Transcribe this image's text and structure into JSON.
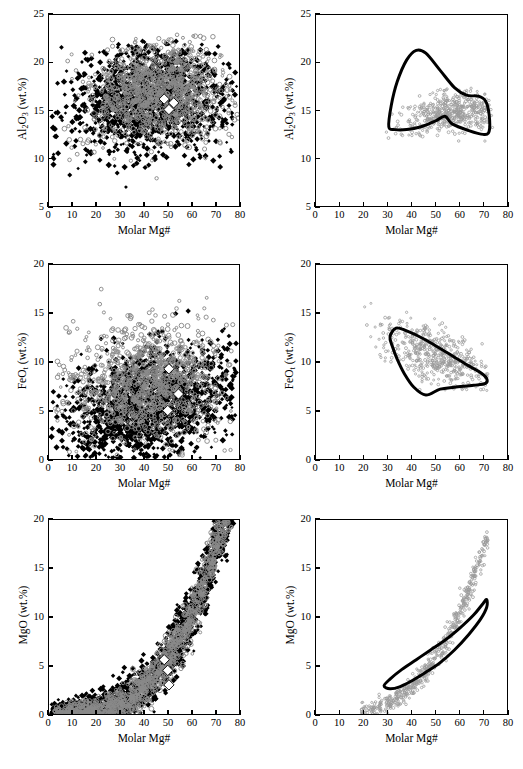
{
  "figure": {
    "layout": "3 rows x 2 columns of scatter plots",
    "columns": [
      "global compilation (filled markers)",
      "restricted subset with outlined field (open markers)"
    ]
  },
  "axes": {
    "x_title_html": "Molar Mg#",
    "x_ticks": [
      0,
      10,
      20,
      30,
      40,
      50,
      60,
      70,
      80
    ],
    "x_range": [
      0,
      80
    ],
    "y_ticks_al": [
      5,
      10,
      15,
      20,
      25
    ],
    "y_range_al": [
      5,
      25
    ],
    "y_ticks_fe": [
      0,
      5,
      10,
      15,
      20
    ],
    "y_range_fe": [
      0,
      20
    ],
    "y_ticks_mg": [
      0,
      5,
      10,
      15,
      20
    ],
    "y_range_mg": [
      0,
      20
    ],
    "y_title_al_html": "Al<sub>2</sub>O<sub>3</sub> (wt.%)",
    "y_title_fe_html": "FeO<sub>t</sub> (wt.%)",
    "y_title_mg_html": "MgO (wt.%)"
  },
  "colors": {
    "axis": "#000000",
    "dense_dark": "#000000",
    "dense_gray": "#8a8a8a",
    "open_marker": "#9a9a9a",
    "contour": "#000000",
    "diamond_fill": "#ffffff",
    "background": "#ffffff"
  },
  "chart_data": [
    {
      "type": "scatter",
      "id": "al2o3-global",
      "title": "",
      "xlabel": "Molar Mg#",
      "ylabel": "Al2O3 (wt.%)",
      "xlim": [
        0,
        80
      ],
      "ylim": [
        5,
        25
      ],
      "xticks": [
        0,
        10,
        20,
        30,
        40,
        50,
        60,
        70,
        80
      ],
      "yticks": [
        5,
        10,
        15,
        20,
        25
      ],
      "grid": false,
      "legend": "none",
      "series": [
        {
          "name": "dark filled cloud",
          "marker": "filled-diamond-dark",
          "color": "#000000",
          "n_points": 1500,
          "cloud": {
            "x_center": 42,
            "y_center": 16.4,
            "x_spread": 17,
            "y_spread": 2.7,
            "x_min": 1,
            "x_max": 79,
            "y_min": 6.2,
            "y_max": 22.6,
            "correlation": 0.1
          }
        },
        {
          "name": "gray open cloud",
          "marker": "open-circle-gray",
          "color": "#8a8a8a",
          "n_points": 1100,
          "cloud": {
            "x_center": 46,
            "y_center": 17.2,
            "x_spread": 15,
            "y_spread": 2.6,
            "x_min": 2,
            "x_max": 80,
            "y_min": 5.2,
            "y_max": 23.0,
            "correlation": 0.05
          }
        },
        {
          "name": "reference averages",
          "marker": "white-diamond",
          "color": "#ffffff",
          "points": [
            [
              48.5,
              16.2
            ],
            [
              52.5,
              15.8
            ],
            [
              50.5,
              15.1
            ]
          ]
        }
      ]
    },
    {
      "type": "scatter",
      "id": "al2o3-subset",
      "title": "",
      "xlabel": "Molar Mg#",
      "ylabel": "Al2O3 (wt.%)",
      "xlim": [
        0,
        80
      ],
      "ylim": [
        5,
        25
      ],
      "xticks": [
        0,
        10,
        20,
        30,
        40,
        50,
        60,
        70,
        80
      ],
      "yticks": [
        5,
        10,
        15,
        20,
        25
      ],
      "grid": false,
      "legend": "none",
      "series": [
        {
          "name": "subset open markers",
          "marker": "open-small-gray",
          "color": "#9a9a9a",
          "n_points": 520,
          "cloud": {
            "x_center": 57,
            "y_center": 15.1,
            "x_spread": 11,
            "y_spread": 1.2,
            "x_min": 18,
            "x_max": 74,
            "y_min": 11.2,
            "y_max": 18.4,
            "correlation": 0.55
          }
        }
      ],
      "contour": {
        "name": "field outline",
        "stroke": "#000000",
        "stroke_width": 3.0,
        "vertices": [
          [
            30.5,
            13.3
          ],
          [
            31.5,
            15.5
          ],
          [
            34,
            18.0
          ],
          [
            38,
            20.3
          ],
          [
            42,
            21.3
          ],
          [
            46,
            21.0
          ],
          [
            52,
            19.2
          ],
          [
            58,
            17.4
          ],
          [
            63,
            16.6
          ],
          [
            68,
            16.5
          ],
          [
            71,
            16.0
          ],
          [
            72.5,
            14.6
          ],
          [
            72.5,
            12.8
          ],
          [
            70,
            12.5
          ],
          [
            64,
            12.9
          ],
          [
            57,
            13.6
          ],
          [
            54,
            14.4
          ],
          [
            50,
            13.9
          ],
          [
            44,
            13.3
          ],
          [
            38,
            13.0
          ],
          [
            33,
            13.0
          ]
        ]
      }
    },
    {
      "type": "scatter",
      "id": "feot-global",
      "title": "",
      "xlabel": "Molar Mg#",
      "ylabel": "FeOt (wt.%)",
      "xlim": [
        0,
        80
      ],
      "ylim": [
        0,
        20
      ],
      "xticks": [
        0,
        10,
        20,
        30,
        40,
        50,
        60,
        70,
        80
      ],
      "yticks": [
        0,
        5,
        10,
        15,
        20
      ],
      "grid": false,
      "legend": "none",
      "series": [
        {
          "name": "dark filled cloud",
          "marker": "filled-diamond-dark",
          "color": "#000000",
          "n_points": 1600,
          "cloud": {
            "x_center": 42,
            "y_center": 5.6,
            "x_spread": 18,
            "y_spread": 2.9,
            "x_min": 1,
            "x_max": 79,
            "y_min": 0.1,
            "y_max": 16.1,
            "correlation": 0.3
          }
        },
        {
          "name": "gray open cloud",
          "marker": "open-circle-gray",
          "color": "#8a8a8a",
          "n_points": 1100,
          "cloud": {
            "x_center": 41,
            "y_center": 7.6,
            "x_spread": 16,
            "y_spread": 3.0,
            "x_min": 2,
            "x_max": 79,
            "y_min": 0.3,
            "y_max": 19.1,
            "correlation": 0.1
          }
        },
        {
          "name": "reference averages",
          "marker": "white-diamond",
          "color": "#ffffff",
          "points": [
            [
              50.5,
              9.3
            ],
            [
              54.5,
              6.7
            ],
            [
              50.0,
              5.0
            ]
          ]
        }
      ]
    },
    {
      "type": "scatter",
      "id": "feot-subset",
      "title": "",
      "xlabel": "Molar Mg#",
      "ylabel": "FeOt (wt.%)",
      "xlim": [
        0,
        80
      ],
      "ylim": [
        0,
        20
      ],
      "xticks": [
        0,
        10,
        20,
        30,
        40,
        50,
        60,
        70,
        80
      ],
      "yticks": [
        0,
        5,
        10,
        15,
        20
      ],
      "grid": false,
      "legend": "none",
      "series": [
        {
          "name": "subset open markers",
          "marker": "open-small-gray",
          "color": "#9a9a9a",
          "n_points": 520,
          "cloud": {
            "x_center": 52,
            "y_center": 10.4,
            "x_spread": 12,
            "y_spread": 1.9,
            "x_min": 19,
            "x_max": 72,
            "y_min": 6.8,
            "y_max": 17.3,
            "correlation": -0.62
          }
        }
      ],
      "contour": {
        "name": "field outline",
        "stroke": "#000000",
        "stroke_width": 3.0,
        "vertices": [
          [
            31,
            12.6
          ],
          [
            33.5,
            13.5
          ],
          [
            38,
            13.2
          ],
          [
            45,
            12.4
          ],
          [
            52,
            11.4
          ],
          [
            58,
            10.5
          ],
          [
            64,
            9.6
          ],
          [
            69,
            8.9
          ],
          [
            71.5,
            8.3
          ],
          [
            71,
            7.8
          ],
          [
            66,
            7.6
          ],
          [
            58,
            7.4
          ],
          [
            52,
            7.2
          ],
          [
            46,
            6.6
          ],
          [
            41,
            7.4
          ],
          [
            37,
            8.8
          ],
          [
            34,
            10.3
          ],
          [
            32,
            11.6
          ]
        ]
      }
    },
    {
      "type": "scatter",
      "id": "mgo-global",
      "title": "",
      "xlabel": "Molar Mg#",
      "ylabel": "MgO (wt.%)",
      "xlim": [
        0,
        80
      ],
      "ylim": [
        0,
        20
      ],
      "xticks": [
        0,
        10,
        20,
        30,
        40,
        50,
        60,
        70,
        80
      ],
      "yticks": [
        0,
        5,
        10,
        15,
        20
      ],
      "grid": false,
      "legend": "none",
      "series": [
        {
          "name": "dark filled cloud",
          "marker": "filled-diamond-dark",
          "color": "#000000",
          "n_points": 1700,
          "curve": {
            "form": "exponential-rise",
            "x_min": 1,
            "x_max": 80,
            "y_at_x10": 0.35,
            "y_at_x30": 1.6,
            "y_at_x50": 4.0,
            "y_at_x65": 7.2,
            "y_at_x78": 15.5,
            "y_spread": 1.5
          },
          "correlation": 0.92
        },
        {
          "name": "gray open cloud",
          "marker": "open-circle-gray",
          "color": "#8a8a8a",
          "n_points": 1200,
          "curve": {
            "form": "exponential-rise",
            "x_min": 2,
            "x_max": 80,
            "y_at_x10": 0.45,
            "y_at_x30": 2.0,
            "y_at_x50": 4.6,
            "y_at_x65": 8.2,
            "y_at_x78": 16.5,
            "y_spread": 1.3
          },
          "correlation": 0.93
        },
        {
          "name": "reference averages",
          "marker": "white-diamond",
          "color": "#ffffff",
          "points": [
            [
              48.5,
              5.6
            ],
            [
              50.0,
              4.5
            ],
            [
              50.5,
              3.0
            ]
          ]
        }
      ]
    },
    {
      "type": "scatter",
      "id": "mgo-subset",
      "title": "",
      "xlabel": "Molar Mg#",
      "ylabel": "MgO (wt.%)",
      "xlim": [
        0,
        80
      ],
      "ylim": [
        0,
        20
      ],
      "xticks": [
        0,
        10,
        20,
        30,
        40,
        50,
        60,
        70,
        80
      ],
      "yticks": [
        0,
        5,
        10,
        15,
        20
      ],
      "grid": false,
      "legend": "none",
      "series": [
        {
          "name": "subset open markers",
          "marker": "open-small-gray",
          "color": "#9a9a9a",
          "n_points": 520,
          "curve": {
            "form": "exponential-rise",
            "x_min": 19,
            "x_max": 72,
            "y_at_x30": 3.1,
            "y_at_x50": 5.6,
            "y_at_x60": 7.4,
            "y_at_x70": 9.8,
            "y_spread": 0.7
          },
          "correlation": 0.93
        }
      ],
      "contour": {
        "name": "field outline",
        "stroke": "#000000",
        "stroke_width": 3.0,
        "vertices": [
          [
            28.5,
            2.9
          ],
          [
            31,
            3.6
          ],
          [
            36,
            4.6
          ],
          [
            42,
            5.6
          ],
          [
            48,
            6.6
          ],
          [
            54,
            7.6
          ],
          [
            60,
            8.8
          ],
          [
            66,
            10.2
          ],
          [
            70,
            11.4
          ],
          [
            71.5,
            11.8
          ],
          [
            71.5,
            11.0
          ],
          [
            69,
            9.8
          ],
          [
            64,
            8.2
          ],
          [
            58,
            6.6
          ],
          [
            52,
            5.3
          ],
          [
            46,
            4.3
          ],
          [
            40,
            3.4
          ],
          [
            35,
            2.8
          ],
          [
            31,
            2.6
          ]
        ]
      }
    }
  ]
}
